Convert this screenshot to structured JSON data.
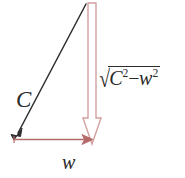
{
  "figure": {
    "background_color": "#ffffff",
    "labels": {
      "hypotenuse": "C",
      "base": "w",
      "height_sqrt_symbol": "√",
      "height_base_1": "C",
      "height_exponent_1": "2",
      "height_operator": "−",
      "height_base_2": "w",
      "height_exponent_2": "2"
    },
    "colors": {
      "hypotenuse_stroke": "#2e2e2e",
      "base_arrow_stroke": "#b56a6a",
      "vertical_arrow_stroke": "#d2a0a0",
      "vertical_arrow_fill": "#ffffff",
      "text": "#2b2b2b"
    },
    "geometry": {
      "hypotenuse_start_x": 86,
      "hypotenuse_start_y": 4,
      "hypotenuse_end_x": 15,
      "hypotenuse_end_y": 139,
      "base_start_x": 14,
      "base_start_y": 139,
      "base_end_x": 91,
      "base_end_y": 139,
      "vertical_top_x": 92,
      "vertical_top_y": 3,
      "vertical_bottom_y": 144,
      "vertical_shaft_half_width": 4,
      "vertical_head_half_width": 9,
      "vertical_head_top_y": 118
    }
  }
}
